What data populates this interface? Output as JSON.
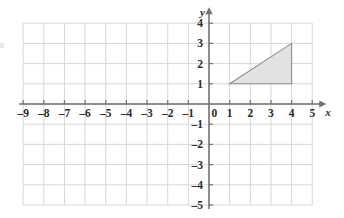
{
  "chart_data": {
    "type": "scatter",
    "title": "",
    "subtitle": "",
    "xlabel": "x",
    "ylabel": "y",
    "xlim": [
      -9,
      5
    ],
    "ylim": [
      -5,
      4
    ],
    "grid": true,
    "legend": null,
    "x_ticks": [
      -9,
      -8,
      -7,
      -6,
      -5,
      -4,
      -3,
      -2,
      -1,
      0,
      1,
      2,
      3,
      4,
      5
    ],
    "y_ticks": [
      -5,
      -4,
      -3,
      -2,
      -1,
      0,
      1,
      2,
      3,
      4
    ],
    "x_tick_labels": [
      "–9",
      "–8",
      "–7",
      "–6",
      "–5",
      "–4",
      "–3",
      "–2",
      "–1",
      "0",
      "1",
      "2",
      "3",
      "4",
      "5"
    ],
    "y_tick_labels": [
      "–5",
      "–4",
      "–3",
      "–2",
      "–1",
      "0",
      "1",
      "2",
      "3",
      "4"
    ],
    "origin_label": "0",
    "shapes": [
      {
        "name": "triangle",
        "kind": "polygon",
        "vertices": [
          [
            1,
            1
          ],
          [
            4,
            1
          ],
          [
            4,
            3
          ]
        ],
        "fill": "#e2e2e2",
        "stroke": "#8d8d90"
      }
    ],
    "series": [],
    "annotations": []
  },
  "axes": {
    "x_axis_label": "x",
    "y_axis_label": "y"
  },
  "colors": {
    "grid": "#d2d2d2",
    "axis": "#6f6f72",
    "shape_fill": "#e2e2e2",
    "shape_stroke": "#8d8d90",
    "text": "#2b2b2b",
    "background": "#ffffff"
  }
}
